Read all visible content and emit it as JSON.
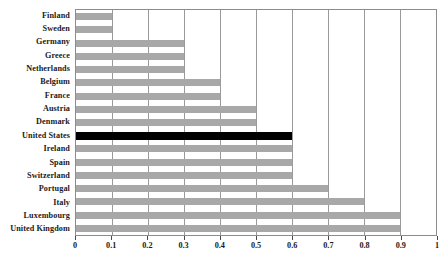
{
  "chart_data": {
    "type": "bar",
    "orientation": "horizontal",
    "title": "",
    "xlabel": "",
    "ylabel": "",
    "xlim": [
      0,
      1
    ],
    "grid": true,
    "legend": "none",
    "highlight_category": "United States",
    "highlight_color": "#000000",
    "bar_color": "#a8a8a8",
    "categories": [
      "Finland",
      "Sweden",
      "Germany",
      "Greece",
      "Netherlands",
      "Belgium",
      "France",
      "Austria",
      "Denmark",
      "United States",
      "Ireland",
      "Spain",
      "Switzerland",
      "Portugal",
      "Italy",
      "Luxembourg",
      "United Kingdom"
    ],
    "values": [
      0.1,
      0.1,
      0.3,
      0.3,
      0.3,
      0.4,
      0.4,
      0.5,
      0.5,
      0.6,
      0.6,
      0.6,
      0.6,
      0.7,
      0.8,
      0.9,
      0.9
    ],
    "xticks": [
      0,
      0.1,
      0.2,
      0.3,
      0.4,
      0.5,
      0.6,
      0.7,
      0.8,
      0.9,
      1
    ],
    "xticklabels": [
      "0",
      "0.1",
      "0.2",
      "0.3",
      "0.4",
      "0.5",
      "0.6",
      "0.7",
      "0.8",
      "0.9",
      "1"
    ]
  }
}
